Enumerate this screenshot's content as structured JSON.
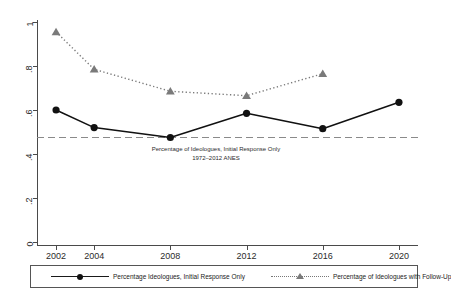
{
  "chart_data": {
    "type": "line",
    "title": "",
    "subtitle": "",
    "xlabel": "",
    "ylabel": "",
    "x": [
      2002,
      2004,
      2008,
      2012,
      2016,
      2020
    ],
    "xlim": [
      2001,
      2021
    ],
    "ylim": [
      0,
      1
    ],
    "grid": false,
    "legend_position": "bottom",
    "xtick_labels": [
      "2002",
      "2004",
      "2008",
      "2012",
      "2016",
      "2020"
    ],
    "ytick_labels": [
      "0",
      ".2",
      ".4",
      ".6",
      ".8",
      "1"
    ],
    "ytick_values": [
      0,
      0.2,
      0.4,
      0.6,
      0.8,
      1
    ],
    "series": [
      {
        "name": "Percentage Ideologues, Initial Response Only",
        "marker": "circle",
        "linestyle": "solid",
        "color": "#111111",
        "x": [
          2002,
          2004,
          2008,
          2012,
          2016,
          2020
        ],
        "values": [
          0.6,
          0.52,
          0.475,
          0.585,
          0.515,
          0.635
        ]
      },
      {
        "name": "Percentage of Ideologues with Follow-Up",
        "marker": "triangle",
        "linestyle": "dotted",
        "color": "#7a7a7a",
        "x": [
          2002,
          2004,
          2008,
          2012,
          2016
        ],
        "values": [
          0.955,
          0.785,
          0.685,
          0.665,
          0.765
        ]
      }
    ],
    "reference_line": {
      "value": 0.475,
      "linestyle": "dashed",
      "color": "#8a8a8a"
    },
    "annotations": [
      {
        "line1": "Percentage of Ideologues, Initial Response Only",
        "line2": "1972–2012 ANES"
      }
    ]
  },
  "legend": {
    "items": [
      {
        "label": "Percentage Ideologues, Initial Response Only",
        "marker": "circle",
        "linestyle": "solid"
      },
      {
        "label": "Percentage of Ideologues with Follow-Up",
        "marker": "triangle",
        "linestyle": "dotted"
      }
    ]
  },
  "axis": {
    "y_labels": [
      "1",
      ".8",
      ".6",
      ".4",
      ".2",
      "0"
    ],
    "x_labels": [
      "2002",
      "2004",
      "2008",
      "2012",
      "2016",
      "2020"
    ]
  }
}
